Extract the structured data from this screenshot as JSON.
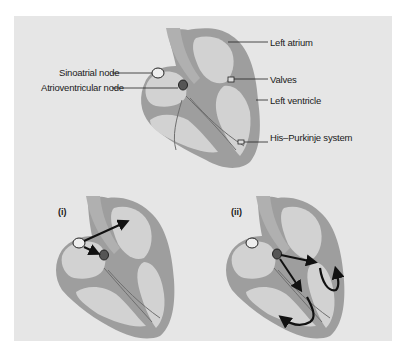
{
  "figure": {
    "background": "#e6e6e6",
    "wall_color": "#9e9e9e",
    "chamber_color": "#d2d2d2",
    "arrow_color": "#111111"
  },
  "top_diagram": {
    "labels": {
      "sinoatrial_node": "Sinoatrial node",
      "atrioventricular_node": "Atrioventricular node",
      "left_atrium": "Left atrium",
      "valves": "Valves",
      "left_ventricle": "Left ventricle",
      "his_purkinje": "His–Purkinje system"
    }
  },
  "bottom_diagrams": [
    {
      "label": "(i)"
    },
    {
      "label": "(ii)"
    }
  ]
}
